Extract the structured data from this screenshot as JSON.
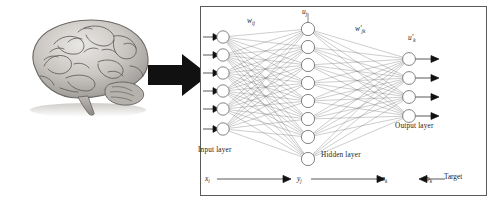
{
  "figure": {
    "brain_label": "brain-illustration",
    "arrow_label": "transformation-arrow"
  },
  "network": {
    "layers": [
      {
        "name": "input",
        "label": "Input layer",
        "nodes": 6
      },
      {
        "name": "hidden",
        "label": "Hidden layer",
        "nodes": 8
      },
      {
        "name": "output",
        "label": "Output layer",
        "nodes": 4
      }
    ],
    "weights": [
      {
        "name": "input-to-hidden",
        "symbol": "w",
        "sub": "ij",
        "prime": false
      },
      {
        "name": "hidden-to-output",
        "symbol": "w",
        "sub": "jk",
        "prime": true
      }
    ],
    "activations": [
      {
        "name": "hidden-net-input",
        "symbol": "u",
        "sub": "j",
        "prime": false
      },
      {
        "name": "output-net-input",
        "symbol": "u",
        "sub": "k",
        "prime": true
      }
    ],
    "signal_flow": [
      {
        "name": "input-signal",
        "symbol": "x",
        "sub": "i"
      },
      {
        "name": "hidden-signal",
        "symbol": "y",
        "sub": "j"
      },
      {
        "name": "output-signal",
        "symbol": "z",
        "sub": "k"
      },
      {
        "name": "target-signal",
        "symbol": "o",
        "sub": "k"
      }
    ],
    "target_label": "Target"
  },
  "colors": {
    "panel_border": "#5a5a5a",
    "node_stroke": "#6e6e6e",
    "connection": "#4a4a4a",
    "arrow_fill": "#111111",
    "text": "#1a1a1a",
    "background": "#ffffff"
  }
}
